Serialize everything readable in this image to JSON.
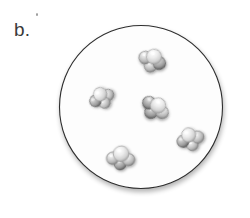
{
  "figure": {
    "panel_label": "b.",
    "background_color": "#ffffff",
    "width": 250,
    "height": 218
  },
  "container": {
    "shape_name": "circle",
    "center_x": 141,
    "center_y": 107,
    "radius": 81.5,
    "stroke_color": "#2e2e2e",
    "stroke_width": 1.1,
    "fill_color": "#fdfdfd",
    "shadow_color": "#d8d8d8"
  },
  "legend": {
    "molecule_count_label": "5",
    "atoms_per_molecule_label": "4",
    "representation_label": "space-filling"
  },
  "molecules": [
    {
      "id": "molecule-1",
      "cx": 153,
      "cy": 58,
      "scale": 1.0,
      "rotation": 18,
      "atoms": [
        {
          "name": "atom-center",
          "dx": 0.5,
          "dy": -1.5,
          "r": 7.6,
          "tone": "light"
        },
        {
          "name": "atom-a",
          "dx": -7.5,
          "dy": 2.0,
          "r": 6.4,
          "tone": "mid"
        },
        {
          "name": "atom-b",
          "dx": 7.6,
          "dy": 3.0,
          "r": 6.4,
          "tone": "dark"
        },
        {
          "name": "atom-c",
          "dx": 0.0,
          "dy": 8.4,
          "r": 6.2,
          "tone": "mid"
        }
      ]
    },
    {
      "id": "molecule-2",
      "cx": 101,
      "cy": 96,
      "scale": 0.95,
      "rotation": -24,
      "atoms": [
        {
          "name": "atom-center",
          "dx": 0.0,
          "dy": -2.0,
          "r": 7.2,
          "tone": "light"
        },
        {
          "name": "atom-a",
          "dx": -7.4,
          "dy": 2.4,
          "r": 6.2,
          "tone": "dark"
        },
        {
          "name": "atom-b",
          "dx": 7.4,
          "dy": 2.0,
          "r": 6.0,
          "tone": "mid"
        },
        {
          "name": "atom-c",
          "dx": 0.6,
          "dy": 8.0,
          "r": 6.0,
          "tone": "mid"
        }
      ]
    },
    {
      "id": "molecule-3",
      "cx": 157,
      "cy": 106,
      "scale": 1.02,
      "rotation": 40,
      "atoms": [
        {
          "name": "atom-center",
          "dx": 0.4,
          "dy": -1.0,
          "r": 7.6,
          "tone": "light"
        },
        {
          "name": "atom-a",
          "dx": -8.0,
          "dy": 2.6,
          "r": 6.4,
          "tone": "dark"
        },
        {
          "name": "atom-b",
          "dx": 7.8,
          "dy": 1.6,
          "r": 6.3,
          "tone": "mid"
        },
        {
          "name": "atom-c",
          "dx": -0.6,
          "dy": 8.6,
          "r": 6.2,
          "tone": "dark"
        }
      ]
    },
    {
      "id": "molecule-4",
      "cx": 190,
      "cy": 137,
      "scale": 0.98,
      "rotation": -8,
      "atoms": [
        {
          "name": "atom-center",
          "dx": -1.0,
          "dy": -2.2,
          "r": 7.3,
          "tone": "light"
        },
        {
          "name": "atom-a",
          "dx": -7.6,
          "dy": 3.4,
          "r": 6.2,
          "tone": "dark"
        },
        {
          "name": "atom-b",
          "dx": 7.8,
          "dy": 1.2,
          "r": 6.3,
          "tone": "mid"
        },
        {
          "name": "atom-c",
          "dx": 1.2,
          "dy": 8.2,
          "r": 6.1,
          "tone": "mid"
        }
      ]
    },
    {
      "id": "molecule-5",
      "cx": 121,
      "cy": 155,
      "scale": 1.0,
      "rotation": 5,
      "atoms": [
        {
          "name": "atom-center",
          "dx": 0.0,
          "dy": -1.2,
          "r": 7.8,
          "tone": "light"
        },
        {
          "name": "atom-a",
          "dx": -8.0,
          "dy": 4.0,
          "r": 6.2,
          "tone": "mid"
        },
        {
          "name": "atom-b",
          "dx": 8.0,
          "dy": 4.0,
          "r": 6.2,
          "tone": "mid"
        },
        {
          "name": "atom-c",
          "dx": 0.0,
          "dy": 9.0,
          "r": 6.0,
          "tone": "dark"
        }
      ]
    }
  ],
  "palette": {
    "sphere_light_highlight": "#ffffff",
    "sphere_light_body": "#e2e2e2",
    "sphere_light_edge": "#9c9c9c",
    "sphere_mid_highlight": "#f2f2f2",
    "sphere_mid_body": "#c9c9c9",
    "sphere_mid_edge": "#7d7d7d",
    "sphere_dark_highlight": "#dcdcdc",
    "sphere_dark_body": "#a8a8a8",
    "sphere_dark_edge": "#5d5d5d",
    "outline": "#2e2e2e",
    "label_text": "#3a3a3a"
  }
}
